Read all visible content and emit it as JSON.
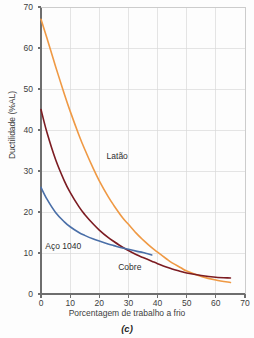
{
  "chart_data": {
    "type": "line",
    "title": "",
    "caption": "(c)",
    "xlabel": "Porcentagem de trabalho a frio",
    "ylabel": "Ductilidade (%AL)",
    "xlim": [
      0,
      70
    ],
    "ylim": [
      0,
      70
    ],
    "xticks": [
      0,
      10,
      20,
      30,
      40,
      50,
      60,
      70
    ],
    "yticks": [
      0,
      10,
      20,
      30,
      40,
      50,
      60,
      70
    ],
    "xtick_labels": [
      "0",
      "10",
      "20",
      "30",
      "40",
      "50",
      "60",
      "70"
    ],
    "ytick_labels": [
      "0",
      "10",
      "20",
      "30",
      "40",
      "50",
      "60",
      "70"
    ],
    "grid": true,
    "grid_color": "#d8d8d8",
    "axis_color": "#6e6e6e",
    "legend": "inline-annotations",
    "series": [
      {
        "name": "Latão",
        "label": "Latão",
        "color": "#ef9944",
        "label_x": 22.5,
        "label_y": 33.5,
        "x": [
          0,
          2,
          5,
          8,
          10,
          13,
          15,
          18,
          20,
          23,
          25,
          28,
          30,
          33,
          35,
          38,
          40,
          43,
          45,
          48,
          50,
          55,
          60,
          65
        ],
        "y": [
          67,
          62.5,
          55.5,
          48.8,
          44.6,
          38.8,
          35.3,
          30.5,
          27.6,
          23.8,
          21.6,
          18.6,
          17.0,
          14.6,
          13.2,
          11.3,
          10.2,
          8.6,
          7.6,
          6.4,
          5.6,
          4.3,
          3.4,
          2.8
        ]
      },
      {
        "name": "Cobre",
        "label": "Cobre",
        "color": "#7c1c22",
        "label_x": 26.5,
        "label_y": 6.5,
        "x": [
          0,
          2,
          5,
          8,
          10,
          13,
          15,
          18,
          20,
          23,
          25,
          28,
          30,
          33,
          35,
          38,
          40,
          43,
          45,
          48,
          50,
          55,
          60,
          65
        ],
        "y": [
          45,
          39.5,
          32.8,
          27.6,
          24.8,
          21.3,
          19.4,
          17.0,
          15.6,
          13.8,
          12.8,
          11.4,
          10.6,
          9.5,
          8.9,
          8.0,
          7.4,
          6.6,
          6.1,
          5.5,
          5.1,
          4.5,
          4.1,
          3.9
        ]
      },
      {
        "name": "Aço 1040",
        "label": "Aço 1040",
        "color": "#4a6fa8",
        "label_x": 1.5,
        "label_y": 11.5,
        "x": [
          0,
          2,
          5,
          8,
          10,
          13,
          15,
          18,
          20,
          23,
          25,
          28,
          30,
          33,
          35,
          38
        ],
        "y": [
          26,
          23.2,
          19.9,
          17.6,
          16.4,
          15.0,
          14.3,
          13.4,
          12.9,
          12.2,
          11.8,
          11.2,
          10.9,
          10.4,
          10.1,
          9.5
        ]
      }
    ]
  }
}
